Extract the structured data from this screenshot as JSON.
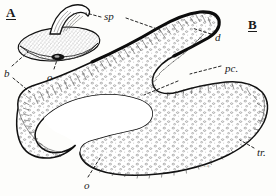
{
  "figure": {
    "kind": "scientific-line-drawing",
    "background_color": "#fdfdfb",
    "ink_color": "#1a1a1a",
    "panels": [
      {
        "id": "A",
        "label": "A",
        "underlined": true,
        "description": "small stippled ovoid body with curved dorsal horn"
      },
      {
        "id": "B",
        "label": "B",
        "underlined": true,
        "description": "long S-curved hatched and stippled band"
      }
    ],
    "annotations": [
      {
        "key": "sp",
        "label": "sp",
        "x": 104,
        "y": 11,
        "style": "italic",
        "leaders": [
          "left-dash-to-horn",
          "right-dash-to-band-crest"
        ]
      },
      {
        "key": "b",
        "label": "b",
        "x": 4,
        "y": 68,
        "style": "italic",
        "leaders": [
          "up-right-dash-to-body-edge",
          "down-right-dash-to-band-tip"
        ]
      },
      {
        "key": "o_upper",
        "label": "o",
        "x": 47,
        "y": 72,
        "style": "italic",
        "leaders": [
          "vertical-dash-to-dark-opening"
        ]
      },
      {
        "key": "d",
        "label": "d",
        "x": 215,
        "y": 32,
        "style": "italic",
        "leaders": [
          "left-dash-to-hook-interior"
        ]
      },
      {
        "key": "pc",
        "label": "pc.",
        "x": 225,
        "y": 63,
        "style": "italic",
        "leaders": [
          "left-dash-to-band-midsection"
        ]
      },
      {
        "key": "tr",
        "label": "tr.",
        "x": 257,
        "y": 147,
        "style": "italic",
        "leaders": [
          "left-dash-to-lower-band-margin"
        ]
      },
      {
        "key": "o_lower",
        "label": "o",
        "x": 84,
        "y": 180,
        "style": "italic",
        "leaders": [
          "up-right-dash-to-band-tip"
        ]
      }
    ],
    "signature": "e.s.q."
  }
}
